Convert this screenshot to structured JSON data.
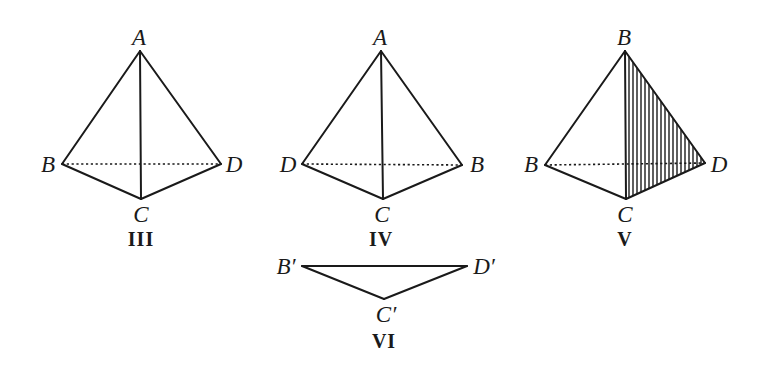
{
  "figures": [
    {
      "id": "III",
      "caption": "III",
      "labels": {
        "top": "A",
        "left": "B",
        "right": "D",
        "bottom": "C"
      },
      "shaded_face": null
    },
    {
      "id": "IV",
      "caption": "IV",
      "labels": {
        "top": "A",
        "left": "D",
        "right": "B",
        "bottom": "C"
      },
      "shaded_face": null
    },
    {
      "id": "V",
      "caption": "V",
      "labels": {
        "top": "B",
        "left": "B",
        "right": "D",
        "bottom": "C"
      },
      "shaded_face": "top-right-bottom"
    },
    {
      "id": "VI",
      "caption": "VI",
      "labels": {
        "left": "B′",
        "right": "D′",
        "bottom": "C′"
      }
    }
  ],
  "colors": {
    "ink": "#1a1a1a",
    "background": "#ffffff"
  }
}
